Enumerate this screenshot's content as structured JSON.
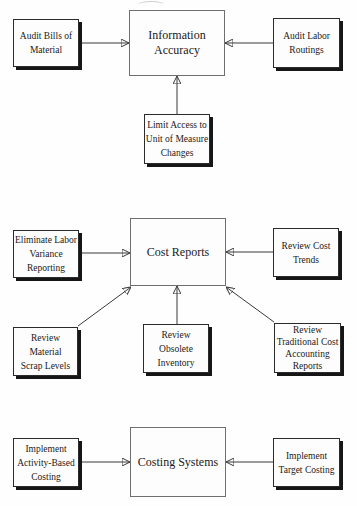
{
  "diagram": {
    "background_color": "#fefefe",
    "line_color": "#3a3a3a",
    "shadow_color": "#161616",
    "sections": [
      {
        "hub": {
          "label": "Information\nAccuracy"
        },
        "satellites": [
          {
            "label": "Audit Bills of\nMaterial"
          },
          {
            "label": "Audit Labor\nRoutings"
          },
          {
            "label": "Limit Access to\nUnit of Measure\nChanges"
          }
        ]
      },
      {
        "hub": {
          "label": "Cost Reports"
        },
        "satellites": [
          {
            "label": "Eliminate Labor\nVariance\nReporting"
          },
          {
            "label": "Review Cost\nTrends"
          },
          {
            "label": "Review Material\nScrap Levels"
          },
          {
            "label": "Review\nObsolete\nInventory"
          },
          {
            "label": "Review\nTraditional Cost\nAccounting\nReports"
          }
        ]
      },
      {
        "hub": {
          "label": "Costing Systems"
        },
        "satellites": [
          {
            "label": "Implement\nActivity-Based\nCosting"
          },
          {
            "label": "Implement\nTarget Costing"
          }
        ]
      }
    ],
    "edges": [
      {
        "from": "Audit Bills of Material",
        "to": "Information Accuracy"
      },
      {
        "from": "Audit Labor Routings",
        "to": "Information Accuracy"
      },
      {
        "from": "Limit Access to Unit of Measure Changes",
        "to": "Information Accuracy"
      },
      {
        "from": "Eliminate Labor Variance Reporting",
        "to": "Cost Reports"
      },
      {
        "from": "Review Cost Trends",
        "to": "Cost Reports"
      },
      {
        "from": "Review Material Scrap Levels",
        "to": "Cost Reports"
      },
      {
        "from": "Review Obsolete Inventory",
        "to": "Cost Reports"
      },
      {
        "from": "Review Traditional Cost Accounting Reports",
        "to": "Cost Reports"
      },
      {
        "from": "Implement Activity-Based Costing",
        "to": "Costing Systems"
      },
      {
        "from": "Implement Target Costing",
        "to": "Costing Systems"
      }
    ]
  }
}
